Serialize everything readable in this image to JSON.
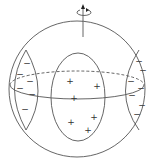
{
  "diagram": {
    "title": "",
    "rotation_axis": {
      "icon": "rotation-arrow-icon",
      "direction": "up"
    },
    "regions": [
      {
        "name": "left-lobe",
        "charge": "negative",
        "symbol": "−",
        "count": 7
      },
      {
        "name": "center-region",
        "charge": "positive",
        "symbol": "+",
        "count": 6
      },
      {
        "name": "right-lobe",
        "charge": "negative",
        "symbol": "−",
        "count": 8
      }
    ],
    "symbols": {
      "minus": "−",
      "plus": "+"
    }
  }
}
